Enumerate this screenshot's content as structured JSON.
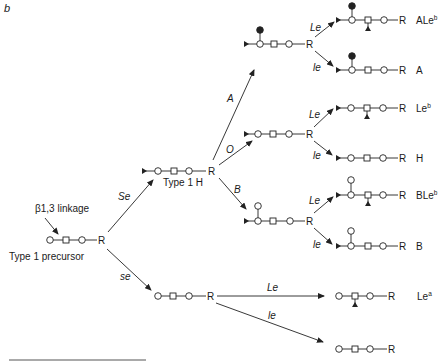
{
  "figure": {
    "panel_label": "b",
    "precursor": {
      "label": "Type 1 precursor",
      "annotation": "β1,3 linkage",
      "terminal": "R"
    },
    "type1h": {
      "label": "Type 1 H",
      "terminal": "R"
    },
    "enzymes": {
      "Se": "Se",
      "se": "se",
      "A": "A",
      "O": "O",
      "B": "B",
      "Le": "Le",
      "le": "le"
    },
    "products": {
      "ALeb": {
        "base": "ALe",
        "sup": "b",
        "terminal": "R"
      },
      "A": {
        "base": "A",
        "terminal": "R"
      },
      "Leb": {
        "base": "Le",
        "sup": "b",
        "terminal": "R"
      },
      "H": {
        "base": "H",
        "terminal": "R"
      },
      "BLeb": {
        "base": "BLe",
        "sup": "b",
        "terminal": "R"
      },
      "B": {
        "base": "B",
        "terminal": "R"
      },
      "Lea": {
        "base": "Le",
        "sup": "a",
        "terminal": "R"
      },
      "unmodified": {
        "terminal": "R"
      }
    },
    "intermediates": {
      "A_branch": {
        "terminal": "R"
      },
      "O_branch": {
        "terminal": "R"
      },
      "B_branch": {
        "terminal": "R"
      },
      "se_branch": {
        "terminal": "R"
      }
    },
    "legend_symbols": {
      "open_circle": "galactose-or-glcnac-circle-icon",
      "open_square": "glcnac-square-icon",
      "filled_triangle": "fucose-triangle-icon",
      "filled_circle": "galnac-circle-icon"
    }
  }
}
